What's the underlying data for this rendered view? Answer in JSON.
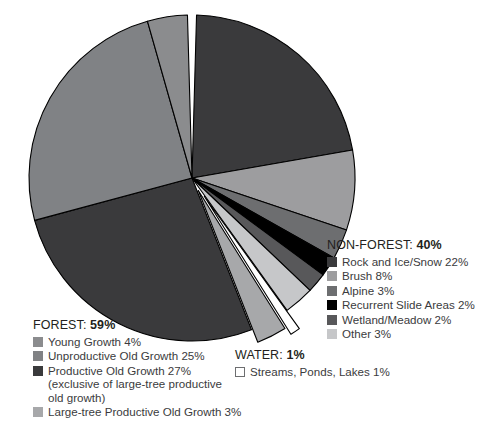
{
  "chart_data": {
    "type": "pie",
    "title": "",
    "start_angle_deg": 0,
    "direction": "clockwise",
    "legend_position": "outside",
    "grid": false,
    "units": "percent",
    "categories": [
      "Rock and Ice/Snow",
      "Brush",
      "Alpine",
      "Recurrent Slide Areas",
      "Wetland/Meadow",
      "Other",
      "Streams, Ponds, Lakes",
      "Large-tree Productive Old Growth",
      "Productive Old Growth",
      "Unproductive Old Growth",
      "Young Growth"
    ],
    "values": [
      22,
      8,
      3,
      2,
      2,
      3,
      1,
      3,
      27,
      25,
      4
    ],
    "colors": [
      "#3a3a3c",
      "#9d9d9f",
      "#6d6e70",
      "#000000",
      "#58585a",
      "#c6c7c9",
      "#ffffff",
      "#a7a8aa",
      "#3a3a3c",
      "#808285",
      "#8b8c8e"
    ],
    "exploded": [
      false,
      false,
      false,
      false,
      false,
      false,
      true,
      true,
      false,
      false,
      false
    ],
    "groups": [
      {
        "name": "FOREST",
        "total": "59%",
        "slices": [
          "Young Growth",
          "Unproductive Old Growth",
          "Productive Old Growth",
          "Large-tree Productive Old Growth"
        ]
      },
      {
        "name": "NON-FOREST",
        "total": "40%",
        "slices": [
          "Rock and Ice/Snow",
          "Brush",
          "Alpine",
          "Recurrent Slide Areas",
          "Wetland/Meadow",
          "Other"
        ]
      },
      {
        "name": "WATER",
        "total": "1%",
        "slices": [
          "Streams, Ponds, Lakes"
        ]
      }
    ]
  },
  "legends": {
    "forest": {
      "title_name": "FOREST:",
      "title_value": "59%",
      "items": [
        {
          "label": "Young Growth",
          "pct": "4%",
          "color": "#8b8c8e",
          "outlined": false
        },
        {
          "label": "Unproductive Old Growth",
          "pct": "25%",
          "color": "#808285",
          "outlined": false
        },
        {
          "label": "Productive Old Growth",
          "pct": "27%",
          "color": "#3a3a3c",
          "outlined": false,
          "note": "(exclusive of large-tree productive\nold growth)"
        },
        {
          "label": "Large-tree Productive Old Growth",
          "pct": "3%",
          "color": "#a7a8aa",
          "outlined": false
        }
      ]
    },
    "nonforest": {
      "title_name": "NON-FOREST:",
      "title_value": "40%",
      "items": [
        {
          "label": "Rock and Ice/Snow",
          "pct": "22%",
          "color": "#3a3a3c",
          "outlined": false
        },
        {
          "label": "Brush",
          "pct": "8%",
          "color": "#9d9d9f",
          "outlined": false
        },
        {
          "label": "Alpine",
          "pct": "3%",
          "color": "#6d6e70",
          "outlined": false
        },
        {
          "label": "Recurrent Slide Areas",
          "pct": "2%",
          "color": "#000000",
          "outlined": false
        },
        {
          "label": "Wetland/Meadow",
          "pct": "2%",
          "color": "#58585a",
          "outlined": false
        },
        {
          "label": "Other",
          "pct": "3%",
          "color": "#c6c7c9",
          "outlined": false
        }
      ]
    },
    "water": {
      "title_name": "WATER:",
      "title_value": "1%",
      "items": [
        {
          "label": "Streams, Ponds, Lakes",
          "pct": "1%",
          "color": "#ffffff",
          "outlined": true
        }
      ]
    }
  }
}
